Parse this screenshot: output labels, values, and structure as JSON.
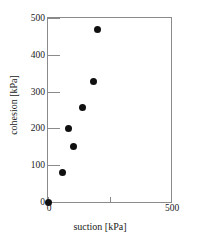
{
  "chart_data": {
    "type": "scatter",
    "title": "",
    "xlabel": "suction [kPa]",
    "ylabel": "cohesion [kPa]",
    "xlim": [
      0,
      500
    ],
    "ylim": [
      0,
      500
    ],
    "xticks": [
      0,
      250,
      500
    ],
    "xtick_labels": [
      "0",
      "",
      "500"
    ],
    "yticks": [
      0,
      100,
      200,
      300,
      400,
      500
    ],
    "ytick_labels": [
      "0",
      "100",
      "200",
      "300",
      "400",
      "500"
    ],
    "grid": false,
    "legend": null,
    "marker": "filled-circle",
    "marker_color": "#101010",
    "frame_color": "#8a8a8a",
    "points": [
      {
        "x": 0,
        "y": 0
      },
      {
        "x": 60,
        "y": 80
      },
      {
        "x": 84,
        "y": 200
      },
      {
        "x": 104,
        "y": 150
      },
      {
        "x": 140,
        "y": 258
      },
      {
        "x": 184,
        "y": 328
      },
      {
        "x": 200,
        "y": 468
      }
    ]
  }
}
